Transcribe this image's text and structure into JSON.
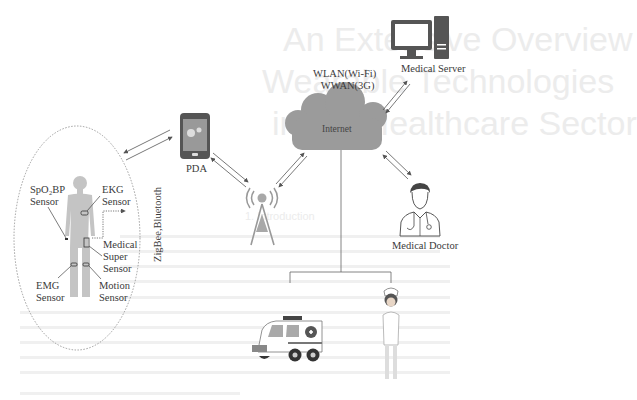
{
  "background_ghost": {
    "title_lines": [
      "An Extensive Overview",
      "Wearable Technologies",
      "in the Healthcare Sector"
    ],
    "section_heading": "1. Introduction"
  },
  "nodes": {
    "server": {
      "label": "Medical Server"
    },
    "network": {
      "line1": "WLAN(Wi-Fi)",
      "line2": "WWAN(3G)"
    },
    "cloud": {
      "label": "Internet"
    },
    "pda": {
      "label": "PDA"
    },
    "doctor": {
      "label": "Medical Doctor"
    },
    "tower": {
      "label": ""
    },
    "ambulance": {
      "label": ""
    },
    "nurse": {
      "label": ""
    }
  },
  "body_area_network": {
    "link_label": "ZigBee,Bluetooth",
    "sensors": [
      {
        "line1": "SpO₂BP",
        "line2": "Sensor"
      },
      {
        "line1": "EKG",
        "line2": "Sensor"
      },
      {
        "line1": "Medical",
        "line2": "Super",
        "line3": "Sensor"
      },
      {
        "line1": "EMG",
        "line2": "Sensor"
      },
      {
        "line1": "Motion",
        "line2": "Sensor"
      }
    ]
  },
  "colors": {
    "icon_dark": "#555555",
    "cloud_fill": "#9a9a9a",
    "body_fill": "#bdbdbd",
    "arrow": "#555555"
  }
}
